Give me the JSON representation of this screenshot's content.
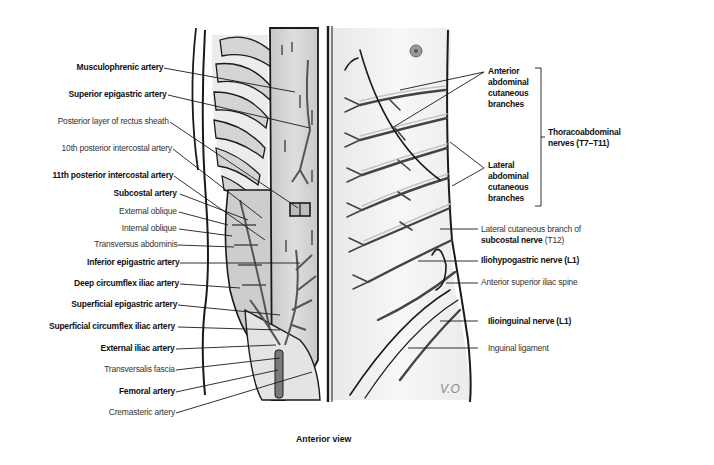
{
  "figure": {
    "caption": "Anterior view",
    "signature": "V.O",
    "colors": {
      "background": "#ffffff",
      "line": "#1a1a1a",
      "muscle_fill": "#cfcfcf",
      "rib_fill": "#d9d9d9",
      "skin_fill": "#f2f2f2",
      "nerve_highlight": "#bdbdbd"
    }
  },
  "left_labels": [
    {
      "text": "Musculophrenic artery",
      "bold": true
    },
    {
      "text": "Superior epigastric artery",
      "bold": true
    },
    {
      "text": "Posterior layer of rectus sheath",
      "bold": false
    },
    {
      "text": "10th posterior intercostal artery",
      "bold": false
    },
    {
      "text": "11th posterior intercostal artery",
      "bold": true
    },
    {
      "text": "Subcostal artery",
      "bold": true
    },
    {
      "text": "External oblique",
      "bold": false
    },
    {
      "text": "Internal oblique",
      "bold": false
    },
    {
      "text": "Transversus abdominis",
      "bold": false
    },
    {
      "text": "Inferior epigastric artery",
      "bold": true
    },
    {
      "text": "Deep circumflex iliac artery",
      "bold": true
    },
    {
      "text": "Superficial epigastric artery",
      "bold": true
    },
    {
      "text": "Superficial circumflex iliac artery",
      "bold": true
    },
    {
      "text": "External iliac artery",
      "bold": true
    },
    {
      "text": "Transversalis fascia",
      "bold": false
    },
    {
      "text": "Femoral artery",
      "bold": true
    },
    {
      "text": "Cremasteric artery",
      "bold": false
    }
  ],
  "right_labels": {
    "anterior_branches": {
      "line1": "Anterior",
      "line2": "abdominal",
      "line3": "cutaneous",
      "line4": "branches"
    },
    "lateral_branches": {
      "line1": "Lateral",
      "line2": "abdominal",
      "line3": "cutaneous",
      "line4": "branches"
    },
    "thoracoabdominal": {
      "line1": "Thoracoabdominal",
      "line2": "nerves (T7–T11)"
    },
    "lateral_cutaneous": {
      "line1": "Lateral cutaneous branch of",
      "bold_part": "subcostal nerve",
      "normal_part": " (T12)"
    },
    "iliohypogastric": "Iliohypogastric nerve (L1)",
    "asis": "Anterior superior iliac spine",
    "ilioinguinal": "Ilioinguinal nerve (L1)",
    "inguinal_ligament": "Inguinal ligament"
  }
}
